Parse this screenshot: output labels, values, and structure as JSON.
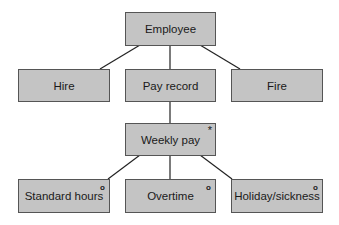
{
  "diagram": {
    "type": "Jackson structure diagram",
    "nodes": [
      {
        "id": "employee",
        "label": "Employee",
        "marker": ""
      },
      {
        "id": "hire",
        "label": "Hire",
        "marker": ""
      },
      {
        "id": "payrecord",
        "label": "Pay record",
        "marker": ""
      },
      {
        "id": "fire",
        "label": "Fire",
        "marker": ""
      },
      {
        "id": "weeklypay",
        "label": "Weekly pay",
        "marker": "*"
      },
      {
        "id": "standard",
        "label": "Standard hours",
        "marker": "o"
      },
      {
        "id": "overtime",
        "label": "Overtime",
        "marker": "o"
      },
      {
        "id": "holiday",
        "label": "Holiday/sickness",
        "marker": "o"
      }
    ],
    "edges": [
      [
        "employee",
        "hire"
      ],
      [
        "employee",
        "payrecord"
      ],
      [
        "employee",
        "fire"
      ],
      [
        "payrecord",
        "weeklypay"
      ],
      [
        "weeklypay",
        "standard"
      ],
      [
        "weeklypay",
        "overtime"
      ],
      [
        "weeklypay",
        "holiday"
      ]
    ],
    "colors": {
      "box_fill": "#c4c4c4",
      "box_border": "#555555",
      "line": "#222222"
    }
  }
}
